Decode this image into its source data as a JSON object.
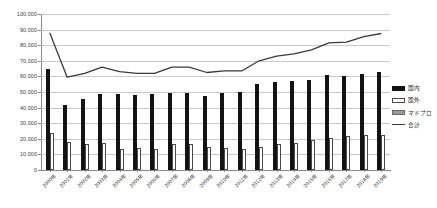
{
  "chart_data": {
    "type": "bar",
    "title": "",
    "xlabel": "",
    "ylabel": "",
    "ylim": [
      0,
      100000
    ],
    "ytick_step": 10000,
    "grid": true,
    "legend_position": "right",
    "categories": [
      "2000年",
      "2001年",
      "2002年",
      "2003年",
      "2004年",
      "2005年",
      "2006年",
      "2007年",
      "2008年",
      "2009年",
      "2010年",
      "2011年",
      "2012年",
      "2013年",
      "2014年",
      "2015年",
      "2016年",
      "2017年",
      "2018年",
      "2019年"
    ],
    "ytick_labels": [
      "0",
      "10,000",
      "20,000",
      "30,000",
      "40,000",
      "50,000",
      "60,000",
      "70,000",
      "80,000",
      "90,000",
      "100,000"
    ],
    "ytick_values": [
      0,
      10000,
      20000,
      30000,
      40000,
      50000,
      60000,
      70000,
      80000,
      90000,
      100000
    ],
    "series": [
      {
        "name": "国内",
        "type": "bar",
        "color": "#131313",
        "values": [
          64500,
          41500,
          45500,
          49000,
          48500,
          48000,
          48500,
          49500,
          49500,
          47500,
          49500,
          50000,
          55000,
          56500,
          57000,
          58000,
          61000,
          60500,
          61500,
          63000
        ]
      },
      {
        "name": "国外",
        "type": "bar",
        "color": "#ffffff",
        "values": [
          23500,
          18000,
          16500,
          17000,
          13500,
          14000,
          13500,
          16500,
          16500,
          14500,
          14000,
          13500,
          15000,
          16500,
          17500,
          19000,
          20500,
          21500,
          22500,
          22500
        ]
      },
      {
        "name": "マドプロ",
        "type": "bar",
        "color": "#9a9a9a",
        "values": [
          0,
          0,
          0,
          0,
          0,
          0,
          0,
          0,
          0,
          0,
          0,
          0,
          0,
          0,
          0,
          0,
          0,
          0,
          0,
          0
        ]
      },
      {
        "name": "合計",
        "type": "line",
        "color": "#3a3a3a",
        "values": [
          88000,
          59500,
          62000,
          66000,
          63000,
          62000,
          62000,
          66000,
          66000,
          62500,
          63500,
          63500,
          70000,
          73000,
          74500,
          77000,
          81500,
          82000,
          85500,
          87500
        ]
      }
    ]
  },
  "legend": {
    "items": [
      {
        "label": "国内",
        "key": "domestic"
      },
      {
        "label": "国外",
        "key": "overseas"
      },
      {
        "label": "マドプロ",
        "key": "madpro"
      },
      {
        "label": "合計",
        "key": "total"
      }
    ]
  }
}
